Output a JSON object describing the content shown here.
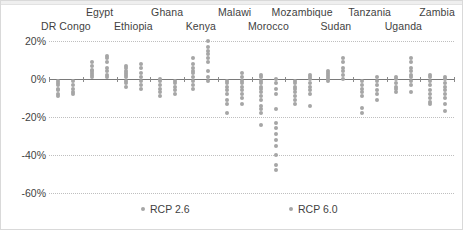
{
  "chart_data": {
    "type": "scatter",
    "title": "",
    "xlabel": "",
    "ylabel": "",
    "ylim": [
      -60,
      20
    ],
    "ytick_labels": [
      "20%",
      "0%",
      "-20%",
      "-40%",
      "-60%"
    ],
    "ytick_values": [
      20,
      0,
      -20,
      -40,
      -60
    ],
    "grid": true,
    "grid_style": "dotted-horizontal",
    "legend_position": "bottom",
    "dot_color": "#a6a6a6",
    "zero_line_color": "#7a7a7a",
    "gridline_color": "#bfbfbf",
    "legend": [
      {
        "name": "RCP 2.6",
        "label": "RCP 2.6"
      },
      {
        "name": "RCP 6.0",
        "label": "RCP 6.0"
      }
    ],
    "categories": [
      "DR Congo",
      "Egypt",
      "Ethiopia",
      "Ghana",
      "Kenya",
      "Malawi",
      "Morocco",
      "Mozambique",
      "Sudan",
      "Tanzania",
      "Uganda",
      "Zambia"
    ],
    "category_label_rows": [
      {
        "label": "DR Congo",
        "row": "bottom"
      },
      {
        "label": "Egypt",
        "row": "top"
      },
      {
        "label": "Ethiopia",
        "row": "bottom"
      },
      {
        "label": "Ghana",
        "row": "top"
      },
      {
        "label": "Kenya",
        "row": "bottom"
      },
      {
        "label": "Malawi",
        "row": "top"
      },
      {
        "label": "Morocco",
        "row": "bottom"
      },
      {
        "label": "Mozambique",
        "row": "top"
      },
      {
        "label": "Sudan",
        "row": "bottom"
      },
      {
        "label": "Tanzania",
        "row": "top"
      },
      {
        "label": "Uganda",
        "row": "bottom"
      },
      {
        "label": "Zambia",
        "row": "top"
      }
    ],
    "series": [
      {
        "name": "RCP 2.6",
        "points_by_category": {
          "DR Congo": [
            -1,
            -2,
            -3,
            -5,
            -6,
            -8,
            -9
          ],
          "Egypt": [
            9,
            7,
            5,
            4,
            3,
            2,
            1
          ],
          "Ethiopia": [
            7,
            6,
            4,
            3,
            2,
            1,
            -1,
            -2,
            -4
          ],
          "Ghana": [
            0,
            -1,
            -3,
            -5,
            -7,
            -9
          ],
          "Kenya": [
            11,
            8,
            6,
            4,
            3,
            1,
            -1,
            -3,
            -5
          ],
          "Malawi": [
            -1,
            -2,
            -4,
            -6,
            -8,
            -11,
            -13,
            -18
          ],
          "Morocco": [
            2,
            1,
            -1,
            -2,
            -4,
            -5,
            -7,
            -9,
            -11,
            -14,
            -16,
            -18,
            -24
          ],
          "Mozambique": [
            -1,
            -2,
            -4,
            -5,
            -7,
            -9,
            -11,
            -13
          ],
          "Sudan": [
            4,
            3,
            2,
            1,
            0,
            -1
          ],
          "Tanzania": [
            -1,
            -3,
            -5,
            -7,
            -9,
            -15,
            -18
          ],
          "Uganda": [
            1,
            0,
            -2,
            -4,
            -5,
            -7
          ],
          "Zambia": [
            2,
            1,
            -1,
            -3,
            -6,
            -8,
            -10,
            -12,
            -13
          ]
        }
      },
      {
        "name": "RCP 6.0",
        "points_by_category": {
          "DR Congo": [
            -1,
            -3,
            -5,
            -7,
            -8
          ],
          "Egypt": [
            12,
            11,
            9,
            6,
            4,
            2,
            1
          ],
          "Ethiopia": [
            8,
            6,
            3,
            1,
            -1,
            -3,
            -5
          ],
          "Ghana": [
            -1,
            -2,
            -4,
            -6,
            -8
          ],
          "Kenya": [
            20,
            17,
            15,
            13,
            11,
            9,
            4,
            1,
            -1
          ],
          "Malawi": [
            3,
            1,
            -1,
            -2,
            -4,
            -6,
            -8,
            -10,
            -13
          ],
          "Morocco": [
            0,
            -2,
            -5,
            -8,
            -16,
            -23,
            -26,
            -29,
            -32,
            -35,
            -40,
            -45,
            -48
          ],
          "Mozambique": [
            2,
            1,
            0,
            -2,
            -4,
            -6,
            -8,
            -14
          ],
          "Sudan": [
            11,
            9,
            6,
            4,
            2,
            0
          ],
          "Tanzania": [
            1,
            -1,
            -3,
            -6,
            -8,
            -11
          ],
          "Uganda": [
            11,
            9,
            6,
            4,
            2,
            1,
            -1,
            -3,
            -7
          ],
          "Zambia": [
            1,
            0,
            -2,
            -4,
            -6,
            -8,
            -10,
            -13,
            -17
          ]
        }
      }
    ]
  },
  "legend": {
    "rcp26_label": "RCP 2.6",
    "rcp60_label": "RCP 6.0"
  }
}
